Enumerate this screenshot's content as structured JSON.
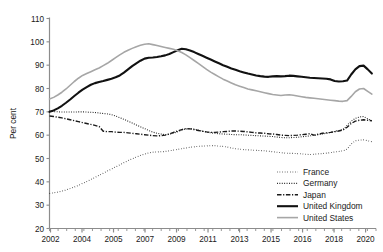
{
  "chart_data": {
    "type": "line",
    "title": "",
    "subtitle": "",
    "xlabel": "",
    "ylabel": "Per cent",
    "ylim": [
      20,
      110
    ],
    "xlim": [
      2002,
      2021.75
    ],
    "ytick_values": [
      20,
      30,
      40,
      50,
      60,
      70,
      80,
      90,
      100,
      110
    ],
    "ytick_labels": [
      "20",
      "30",
      "40",
      "50",
      "60",
      "70",
      "80",
      "90",
      "100",
      "110"
    ],
    "xtick_values": [
      2002,
      2004,
      2005,
      2007,
      2009,
      2011,
      2013,
      2015,
      2016,
      2018,
      2020
    ],
    "xtick_labels": [
      "2002",
      "2004",
      "2005",
      "2007",
      "2009",
      "2011",
      "2013",
      "2015",
      "2016",
      "2018",
      "2020"
    ],
    "grid": false,
    "legend_position": "bottom-right",
    "x": [
      2002,
      2002.25,
      2002.5,
      2002.75,
      2003,
      2003.25,
      2003.5,
      2003.75,
      2004,
      2004.25,
      2004.5,
      2004.75,
      2005,
      2005.25,
      2005.5,
      2005.75,
      2006,
      2006.25,
      2006.5,
      2006.75,
      2007,
      2007.25,
      2007.5,
      2007.75,
      2008,
      2008.25,
      2008.5,
      2008.75,
      2009,
      2009.25,
      2009.5,
      2009.75,
      2010,
      2010.25,
      2010.5,
      2010.75,
      2011,
      2011.25,
      2011.5,
      2011.75,
      2012,
      2012.25,
      2012.5,
      2012.75,
      2013,
      2013.25,
      2013.5,
      2013.75,
      2014,
      2014.25,
      2014.5,
      2014.75,
      2015,
      2015.25,
      2015.5,
      2015.75,
      2016,
      2016.25,
      2016.5,
      2016.75,
      2017,
      2017.25,
      2017.5,
      2017.75,
      2018,
      2018.25,
      2018.5,
      2018.75,
      2019,
      2019.25,
      2019.5,
      2019.75,
      2020,
      2020.25,
      2020.5,
      2020.75,
      2021,
      2021.25,
      2021.5
    ],
    "series": [
      {
        "name": "France",
        "style": "dotted",
        "color": "#1a1a1a",
        "width": 1.1,
        "values": [
          35.0,
          35.3,
          35.6,
          36.0,
          36.5,
          37.1,
          37.8,
          38.5,
          39.3,
          40.1,
          41.0,
          41.9,
          42.8,
          43.7,
          44.6,
          45.5,
          46.4,
          47.3,
          48.2,
          49.1,
          49.9,
          50.6,
          51.3,
          51.9,
          52.4,
          52.7,
          52.8,
          52.9,
          53.0,
          53.3,
          53.6,
          53.9,
          54.2,
          54.5,
          54.8,
          55.0,
          55.2,
          55.3,
          55.4,
          55.5,
          55.5,
          55.3,
          55.2,
          54.9,
          54.5,
          54.2,
          54.0,
          53.8,
          53.7,
          53.6,
          53.5,
          53.4,
          53.3,
          53.1,
          52.9,
          52.7,
          52.5,
          52.3,
          52.2,
          52.2,
          52.1,
          52.0,
          51.8,
          51.7,
          51.8,
          52.0,
          52.1,
          52.3,
          52.5,
          52.8,
          53.0,
          53.3,
          54.0,
          56.2,
          57.6,
          57.9,
          58.0,
          57.6,
          57.2
        ]
      },
      {
        "name": "Germany",
        "style": "dotted-fine",
        "color": "#1a1a1a",
        "width": 1.1,
        "values": [
          70.2,
          70.1,
          70.0,
          69.9,
          69.9,
          69.9,
          69.9,
          70.0,
          70.0,
          69.9,
          69.8,
          69.7,
          69.5,
          69.3,
          69.1,
          68.8,
          68.2,
          67.5,
          66.8,
          66.0,
          65.2,
          64.4,
          63.6,
          62.8,
          62.0,
          61.3,
          60.8,
          60.5,
          60.2,
          60.4,
          60.8,
          61.5,
          62.2,
          62.6,
          62.8,
          62.6,
          62.2,
          61.7,
          61.3,
          61.0,
          60.8,
          60.6,
          60.5,
          60.4,
          60.3,
          60.2,
          60.2,
          60.1,
          60.0,
          59.9,
          59.8,
          59.7,
          59.6,
          59.5,
          59.4,
          59.2,
          59.0,
          58.9,
          58.9,
          59.0,
          59.1,
          59.3,
          59.5,
          59.7,
          59.9,
          60.2,
          60.5,
          60.8,
          61.2,
          61.6,
          62.0,
          62.4,
          64.2,
          66.0,
          67.2,
          67.8,
          68.0,
          67.0,
          66.2
        ]
      },
      {
        "name": "Japan",
        "style": "dashdot",
        "color": "#1a1a1a",
        "width": 1.4,
        "values": [
          68.2,
          68.0,
          67.7,
          67.4,
          67.0,
          66.6,
          66.2,
          65.8,
          65.4,
          65.0,
          64.6,
          64.2,
          63.7,
          61.7,
          61.5,
          61.5,
          61.3,
          61.2,
          61.2,
          61.0,
          60.8,
          60.6,
          60.4,
          60.2,
          60.0,
          59.8,
          59.7,
          59.8,
          60.0,
          60.5,
          61.2,
          61.8,
          62.4,
          62.8,
          62.7,
          62.4,
          62.0,
          61.7,
          61.4,
          61.2,
          61.2,
          61.3,
          61.5,
          61.6,
          61.8,
          61.8,
          61.7,
          61.6,
          61.4,
          61.2,
          61.0,
          60.9,
          60.8,
          60.6,
          60.5,
          60.3,
          60.0,
          59.9,
          59.8,
          59.9,
          60.0,
          60.2,
          60.4,
          60.6,
          60.0,
          60.4,
          60.8,
          61.0,
          61.2,
          61.5,
          61.8,
          62.2,
          63.4,
          65.0,
          66.0,
          66.4,
          66.6,
          66.4,
          66.2
        ]
      },
      {
        "name": "United Kingdom",
        "style": "solid",
        "color": "#111111",
        "width": 2.1,
        "values": [
          70.0,
          70.6,
          71.5,
          72.6,
          73.9,
          75.3,
          76.8,
          78.2,
          79.5,
          80.6,
          81.6,
          82.3,
          82.8,
          83.2,
          83.7,
          84.2,
          84.8,
          85.6,
          86.8,
          88.2,
          89.6,
          90.8,
          91.9,
          92.8,
          93.2,
          93.3,
          93.5,
          93.8,
          94.2,
          94.8,
          95.6,
          96.4,
          97.0,
          96.8,
          96.3,
          95.6,
          94.8,
          94.0,
          93.2,
          92.4,
          91.6,
          90.8,
          90.0,
          89.3,
          88.6,
          88.0,
          87.4,
          86.9,
          86.4,
          86.0,
          85.6,
          85.3,
          85.1,
          85.0,
          85.2,
          85.3,
          85.2,
          85.3,
          85.5,
          85.4,
          85.2,
          85.0,
          84.8,
          84.6,
          84.5,
          84.4,
          84.3,
          84.2,
          83.9,
          83.2,
          83.0,
          83.1,
          83.4,
          86.0,
          88.2,
          89.6,
          89.8,
          88.2,
          86.4
        ]
      },
      {
        "name": "United States",
        "style": "solid",
        "color": "#a6a6a6",
        "width": 1.6,
        "values": [
          75.5,
          76.2,
          77.2,
          78.4,
          79.8,
          81.4,
          83.0,
          84.4,
          85.6,
          86.4,
          87.2,
          88.0,
          88.8,
          89.8,
          90.8,
          92.0,
          93.2,
          94.4,
          95.5,
          96.4,
          97.2,
          97.9,
          98.5,
          99.0,
          99.2,
          98.8,
          98.4,
          98.0,
          97.6,
          97.2,
          96.8,
          96.2,
          95.4,
          94.4,
          93.2,
          92.0,
          90.8,
          89.5,
          88.2,
          87.0,
          86.0,
          85.0,
          84.0,
          83.2,
          82.4,
          81.6,
          81.0,
          80.4,
          79.8,
          79.4,
          79.0,
          78.6,
          78.2,
          77.8,
          77.4,
          77.2,
          77.0,
          77.2,
          77.3,
          77.1,
          76.8,
          76.5,
          76.2,
          76.0,
          75.8,
          75.6,
          75.4,
          75.2,
          75.0,
          74.8,
          74.6,
          74.5,
          74.8,
          76.6,
          78.6,
          79.8,
          80.0,
          78.8,
          77.6
        ]
      }
    ]
  },
  "legend": {
    "items": [
      {
        "label": "France"
      },
      {
        "label": "Germany"
      },
      {
        "label": "Japan"
      },
      {
        "label": "United Kingdom"
      },
      {
        "label": "United States"
      }
    ]
  }
}
